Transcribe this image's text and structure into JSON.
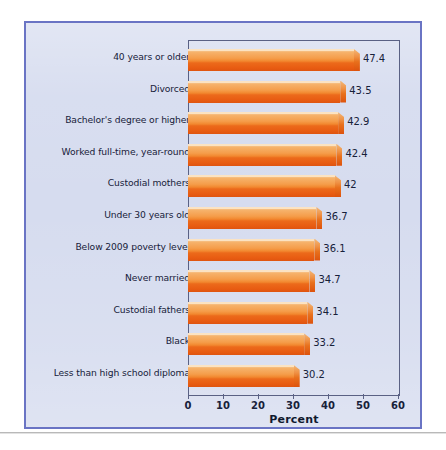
{
  "chart_data": {
    "type": "bar",
    "orientation": "horizontal",
    "title": "",
    "xlabel": "Percent",
    "ylabel": "",
    "xlim": [
      0,
      60
    ],
    "xticks": [
      0,
      10,
      20,
      30,
      40,
      50,
      60
    ],
    "grid": false,
    "legend": null,
    "categories": [
      "40 years or older",
      "Divorced",
      "Bachelor's degree or higher",
      "Worked full-time, year-round",
      "Custodial mothers",
      "Under 30 years old",
      "Below 2009 poverty level",
      "Never married",
      "Custodial fathers",
      "Black",
      "Less than high school diploma"
    ],
    "values": [
      47.4,
      43.5,
      42.9,
      42.4,
      42,
      36.7,
      36.1,
      34.7,
      34.1,
      33.2,
      30.2
    ],
    "value_labels": [
      "47.4",
      "43.5",
      "42.9",
      "42.4",
      "42",
      "36.7",
      "36.1",
      "34.7",
      "34.1",
      "33.2",
      "30.2"
    ],
    "tick_labels": [
      "0",
      "10",
      "20",
      "30",
      "40",
      "50",
      "60"
    ]
  },
  "style": {
    "panel_background": "#d6dcef",
    "panel_border": "#6a74c4",
    "bar_light": "#f6b169",
    "bar_dark": "#e85c12",
    "text_color": "#17213a",
    "axis_color": "#5a6184",
    "page_background": "#ffffff",
    "rule_color": "#b9b9b9"
  },
  "watermark": {
    "text": "Preview"
  }
}
